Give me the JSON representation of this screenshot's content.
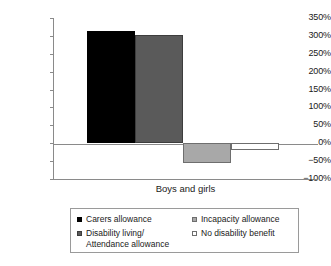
{
  "chart_data": {
    "type": "bar",
    "title": "",
    "subtitle": "",
    "xlabel": "Boys and girls",
    "ylabel": "",
    "categories": [
      "Boys and girls"
    ],
    "ylim": [
      -100,
      350
    ],
    "ytick_labels": [
      "350%",
      "300%",
      "250%",
      "200%",
      "150%",
      "100%",
      "50%",
      "0%",
      "−50%",
      "−100%"
    ],
    "ytick_values": [
      350,
      300,
      250,
      200,
      150,
      100,
      50,
      0,
      -50,
      -100
    ],
    "grid": false,
    "legend_position": "bottom",
    "value_suffix": "%",
    "series": [
      {
        "name": "Carers allowance",
        "values": [
          313
        ],
        "color": "#000000",
        "border": "#000000"
      },
      {
        "name": "Disability living/\nAttendance allowance",
        "values": [
          302
        ],
        "color": "#5a5a5a",
        "border": "#3d3d3d"
      },
      {
        "name": "Incapacity allowance",
        "values": [
          -55
        ],
        "color": "#a8a8a8",
        "border": "#6e6e6e"
      },
      {
        "name": "No disability benefit",
        "values": [
          -18
        ],
        "color": "#ffffff",
        "border": "#6e6e6e"
      }
    ]
  },
  "legend": {
    "items": [
      {
        "label": "Carers allowance",
        "swatch": "black-square-swatch"
      },
      {
        "label": "Disability living/\nAttendance allowance",
        "swatch": "dark-gray-square-swatch"
      },
      {
        "label": "Incapacity allowance",
        "swatch": "medium-gray-square-swatch"
      },
      {
        "label": "No disability benefit",
        "swatch": "white-square-swatch"
      }
    ]
  },
  "axis": {
    "x_title": "Boys and girls"
  },
  "colors": {
    "axis_line": "#8a8a8a",
    "text": "#1a1a1a",
    "series_1": "#000000",
    "series_2": "#5a5a5a",
    "series_3": "#a8a8a8",
    "series_4": "#ffffff"
  }
}
